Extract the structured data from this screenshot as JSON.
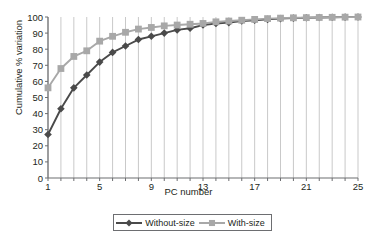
{
  "chart_data": {
    "type": "line",
    "title": "",
    "xlabel": "PC number",
    "ylabel": "Cumulative % variation",
    "xlim": [
      1,
      25
    ],
    "ylim": [
      0,
      100
    ],
    "grid": "vertical-only",
    "legend_position": "bottom",
    "x": [
      1,
      2,
      3,
      4,
      5,
      6,
      7,
      8,
      9,
      10,
      11,
      12,
      13,
      14,
      15,
      16,
      17,
      18,
      19,
      20,
      21,
      22,
      23,
      24,
      25
    ],
    "y_ticks": [
      0,
      10,
      20,
      30,
      40,
      50,
      60,
      70,
      80,
      90,
      100
    ],
    "x_ticks": [
      1,
      5,
      9,
      13,
      17,
      21,
      25
    ],
    "x_tick_labels": [
      "1",
      "5",
      "9",
      "13",
      "17",
      "21",
      "25"
    ],
    "y_tick_labels": [
      "0",
      "10",
      "20",
      "30",
      "40",
      "50",
      "60",
      "70",
      "80",
      "90",
      "100"
    ],
    "series": [
      {
        "name": "Without-size",
        "color": "#4a4a4a",
        "marker": "diamond",
        "values": [
          27,
          43,
          56,
          64,
          72,
          78,
          82,
          86,
          88,
          90,
          92,
          93,
          95,
          96,
          96.5,
          97.5,
          98,
          98.5,
          99,
          99.3,
          99.5,
          99.7,
          99.8,
          99.9,
          100
        ]
      },
      {
        "name": "With-size",
        "color": "#a8a8a8",
        "marker": "square",
        "values": [
          56,
          68,
          75.5,
          79,
          85,
          88,
          90.5,
          92.5,
          93.5,
          94.5,
          95,
          95.5,
          96,
          97,
          97.5,
          98,
          98.5,
          99,
          99.3,
          99.5,
          99.6,
          99.7,
          99.8,
          99.9,
          100
        ]
      }
    ]
  },
  "legend": {
    "items": [
      {
        "label": "Without-size"
      },
      {
        "label": "With-size"
      }
    ]
  },
  "axis": {
    "x_title": "PC number",
    "y_title": "Cumulative % variation"
  },
  "colors": {
    "series_without_size": "#4a4a4a",
    "series_with_size": "#a8a8a8",
    "gridline": "#c9c9c9",
    "axis": "#6d6e71",
    "text": "#231f20"
  }
}
